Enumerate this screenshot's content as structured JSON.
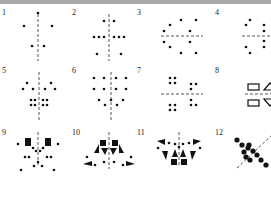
{
  "figure": {
    "topbar_color": "#a8a8a8",
    "ink": "#111111",
    "axis_color": "#555555",
    "panels": [
      {
        "label": "1",
        "x": 2,
        "y": 9,
        "axis": {
          "type": "v",
          "x": 36,
          "y1": 5,
          "y2": 52
        },
        "dots": [
          [
            36,
            4
          ],
          [
            22,
            17
          ],
          [
            50,
            17
          ],
          [
            30,
            37
          ],
          [
            42,
            37
          ]
        ],
        "rects": [],
        "tris": []
      },
      {
        "label": "2",
        "x": 72,
        "y": 9,
        "axis": {
          "type": "v",
          "x": 37,
          "y1": 5,
          "y2": 52
        },
        "dots": [
          [
            32,
            12
          ],
          [
            42,
            12
          ],
          [
            22,
            28
          ],
          [
            27,
            28
          ],
          [
            32,
            28
          ],
          [
            42,
            28
          ],
          [
            47,
            28
          ],
          [
            52,
            28
          ],
          [
            25,
            45
          ],
          [
            49,
            45
          ]
        ],
        "rects": [],
        "tris": []
      },
      {
        "label": "3",
        "x": 137,
        "y": 9,
        "axis": {
          "type": "h",
          "y": 27,
          "x1": 24,
          "x2": 66
        },
        "dots": [
          [
            44,
            11
          ],
          [
            59,
            11
          ],
          [
            33,
            16
          ],
          [
            27,
            22
          ],
          [
            53,
            22
          ],
          [
            27,
            33
          ],
          [
            53,
            33
          ],
          [
            33,
            38
          ],
          [
            44,
            44
          ],
          [
            59,
            44
          ]
        ],
        "rects": [],
        "tris": []
      },
      {
        "label": "4",
        "x": 215,
        "y": 9,
        "axis": {
          "type": "h",
          "y": 27,
          "x1": 27,
          "x2": 70
        },
        "dots": [
          [
            35,
            11
          ],
          [
            63,
            11
          ],
          [
            31,
            16
          ],
          [
            49,
            16
          ],
          [
            67,
            16
          ],
          [
            49,
            22
          ],
          [
            49,
            32
          ],
          [
            49,
            38
          ],
          [
            31,
            38
          ],
          [
            67,
            38
          ],
          [
            35,
            44
          ],
          [
            63,
            44
          ]
        ],
        "rects": [],
        "tris": []
      },
      {
        "label": "5",
        "x": 2,
        "y": 67,
        "axis": {
          "type": "v",
          "x": 37,
          "y1": 5,
          "y2": 54
        },
        "dots": [
          [
            25,
            16
          ],
          [
            49,
            16
          ],
          [
            21,
            22
          ],
          [
            31,
            22
          ],
          [
            43,
            22
          ],
          [
            53,
            22
          ],
          [
            29,
            33
          ],
          [
            33,
            33
          ],
          [
            41,
            33
          ],
          [
            45,
            33
          ],
          [
            29,
            38
          ],
          [
            33,
            38
          ],
          [
            41,
            38
          ],
          [
            45,
            38
          ]
        ],
        "rects": [],
        "tris": []
      },
      {
        "label": "6",
        "x": 72,
        "y": 67,
        "axis": {
          "type": "v",
          "x": 39,
          "y1": 5,
          "y2": 54
        },
        "dots": [
          [
            22,
            11
          ],
          [
            32,
            11
          ],
          [
            44,
            11
          ],
          [
            54,
            11
          ],
          [
            22,
            22
          ],
          [
            32,
            22
          ],
          [
            44,
            22
          ],
          [
            54,
            22
          ],
          [
            27,
            33
          ],
          [
            39,
            33
          ],
          [
            51,
            33
          ],
          [
            33,
            38
          ],
          [
            45,
            38
          ]
        ],
        "rects": [],
        "tris": []
      },
      {
        "label": "7",
        "x": 137,
        "y": 67,
        "axis": {
          "type": "h",
          "y": 27,
          "x1": 24,
          "x2": 66
        },
        "dots": [
          [
            33,
            11
          ],
          [
            38,
            11
          ],
          [
            33,
            16
          ],
          [
            38,
            16
          ],
          [
            54,
            17
          ],
          [
            59,
            17
          ],
          [
            54,
            22
          ],
          [
            33,
            38
          ],
          [
            38,
            38
          ],
          [
            33,
            43
          ],
          [
            38,
            43
          ],
          [
            54,
            33
          ],
          [
            54,
            38
          ],
          [
            59,
            38
          ]
        ],
        "rects": [],
        "tris": []
      },
      {
        "label": "8",
        "x": 215,
        "y": 67,
        "axis": {
          "type": "h",
          "y": 27,
          "x1": 30,
          "x2": 72
        },
        "dots": [
          [
            66,
            7
          ],
          [
            66,
            47
          ]
        ],
        "rects": [
          [
            33,
            17,
            11,
            6,
            "outline"
          ],
          [
            33,
            33,
            11,
            6,
            "outline"
          ]
        ],
        "tris": [
          [
            [
              49,
              23
            ],
            [
              61,
              23
            ],
            [
              55,
              16
            ],
            "outline"
          ],
          [
            [
              49,
              32
            ],
            [
              61,
              32
            ],
            [
              55,
              39
            ],
            "outline"
          ]
        ]
      },
      {
        "label": "9",
        "x": 2,
        "y": 129,
        "axis": {
          "type": "v",
          "x": 36,
          "y1": 3,
          "y2": 38
        },
        "dots": [
          [
            16,
            15
          ],
          [
            56,
            15
          ],
          [
            31,
            19
          ],
          [
            41,
            19
          ],
          [
            34,
            22
          ],
          [
            38,
            22
          ],
          [
            23,
            28
          ],
          [
            27,
            28
          ],
          [
            45,
            28
          ],
          [
            49,
            28
          ],
          [
            36,
            33
          ],
          [
            32,
            37
          ],
          [
            40,
            37
          ],
          [
            19,
            41
          ],
          [
            52,
            41
          ]
        ],
        "rects": [
          [
            23,
            9,
            6,
            8,
            "fill"
          ],
          [
            43,
            9,
            6,
            8,
            "fill"
          ]
        ],
        "tris": []
      },
      {
        "label": "10",
        "x": 72,
        "y": 129,
        "axis": {
          "type": "v",
          "x": 37,
          "y1": 3,
          "y2": 40
        },
        "dots": [
          [
            15,
            28
          ],
          [
            59,
            28
          ],
          [
            23,
            36
          ],
          [
            51,
            36
          ],
          [
            32,
            33
          ],
          [
            42,
            33
          ]
        ],
        "rects": [
          [
            28,
            11,
            6,
            6,
            "fill"
          ],
          [
            40,
            11,
            6,
            6,
            "fill"
          ]
        ],
        "tris": [
          [
            [
              22,
              24
            ],
            [
              27,
              15
            ],
            [
              27,
              24
            ],
            "fill"
          ],
          [
            [
              52,
              24
            ],
            [
              47,
              15
            ],
            [
              47,
              24
            ],
            "fill"
          ],
          [
            [
              29,
              19
            ],
            [
              36,
              19
            ],
            [
              33,
              26
            ],
            "fill"
          ],
          [
            [
              38,
              19
            ],
            [
              45,
              19
            ],
            [
              41,
              26
            ],
            "fill"
          ],
          [
            [
              11,
              35
            ],
            [
              20,
              32
            ],
            [
              20,
              37
            ],
            "fill"
          ],
          [
            [
              63,
              35
            ],
            [
              54,
              32
            ],
            [
              54,
              37
            ],
            "fill"
          ]
        ]
      },
      {
        "label": "11",
        "x": 137,
        "y": 129,
        "axis": {
          "type": "v",
          "x": 42,
          "y1": 3,
          "y2": 38
        },
        "dots": [
          [
            32,
            14
          ],
          [
            52,
            14
          ],
          [
            38,
            15
          ],
          [
            46,
            15
          ],
          [
            42,
            18
          ],
          [
            21,
            19
          ],
          [
            63,
            19
          ]
        ],
        "rects": [
          [
            34,
            30,
            6,
            6,
            "fill"
          ],
          [
            44,
            30,
            6,
            6,
            "fill"
          ]
        ],
        "tris": [
          [
            [
              20,
              12
            ],
            [
              28,
              10
            ],
            [
              28,
              16
            ],
            "fill"
          ],
          [
            [
              64,
              12
            ],
            [
              56,
              10
            ],
            [
              56,
              16
            ],
            "fill"
          ],
          [
            [
              25,
              22
            ],
            [
              31,
              22
            ],
            [
              29,
              31
            ],
            "fill"
          ],
          [
            [
              59,
              22
            ],
            [
              53,
              22
            ],
            [
              55,
              31
            ],
            "fill"
          ],
          [
            [
              35,
              28
            ],
            [
              41,
              28
            ],
            [
              38,
              20
            ],
            "fill"
          ],
          [
            [
              43,
              28
            ],
            [
              49,
              28
            ],
            [
              46,
              20
            ],
            "fill"
          ]
        ]
      },
      {
        "label": "12",
        "x": 215,
        "y": 129,
        "axis": {
          "type": "d",
          "x1": 22,
          "y1": 39,
          "x2": 57,
          "y2": 6
        },
        "dots": [
          [
            22,
            11
          ],
          [
            27,
            16
          ],
          [
            34,
            16
          ],
          [
            29,
            23
          ],
          [
            33,
            19
          ],
          [
            38,
            22
          ],
          [
            42,
            26
          ],
          [
            31,
            28
          ],
          [
            35,
            31
          ],
          [
            46,
            31
          ],
          [
            51,
            36
          ]
        ],
        "rects": [],
        "tris": []
      }
    ]
  }
}
